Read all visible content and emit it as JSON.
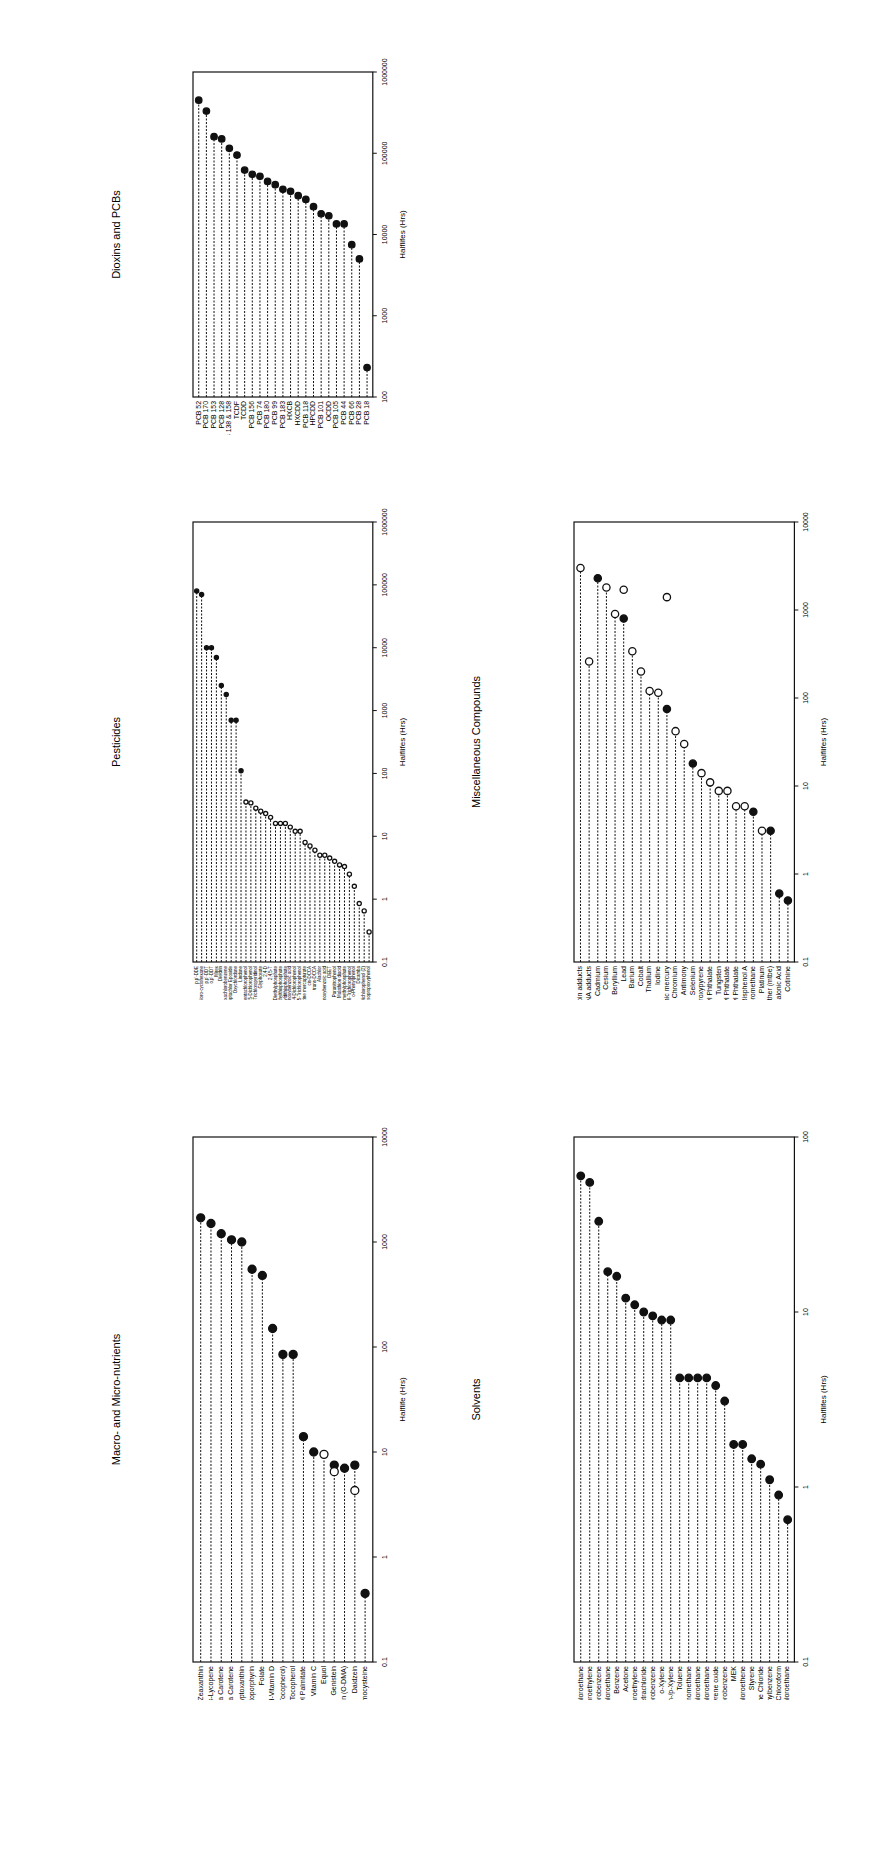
{
  "page": {
    "background": "#ffffff",
    "ink": "#111111"
  },
  "chart_data": [
    {
      "id": "dioxins",
      "type": "lollipop",
      "title": "Dioxins and PCBs",
      "ylabel": "Halflifes (Hrs)",
      "scale": "log",
      "ylim": [
        100,
        1000000
      ],
      "ticks": [
        "100",
        "1000",
        "10000",
        "100000",
        "1000000"
      ],
      "categories": [
        "PCB 52",
        "PCB 170",
        "PCB 153",
        "PCB 128",
        "PCB 138 & 158",
        "TCDF",
        "TCDD",
        "PCB 156",
        "PCB 74",
        "PCB 180",
        "PCB 99",
        "PCB 183",
        "HXCB",
        "HXCDD",
        "PCB 118",
        "HPCDD",
        "PCB 101",
        "OCDD",
        "PCB 105",
        "PCB 44",
        "PCB 66",
        "PCB 28",
        "PCB 18"
      ],
      "values": [
        450000,
        330000,
        160000,
        150000,
        115000,
        95000,
        62000,
        55000,
        52000,
        45000,
        41000,
        36000,
        34000,
        30000,
        27000,
        22000,
        18000,
        17000,
        13500,
        13500,
        7500,
        5000,
        230
      ],
      "filled": [
        true,
        true,
        true,
        true,
        true,
        true,
        true,
        true,
        true,
        true,
        true,
        true,
        true,
        true,
        true,
        true,
        true,
        true,
        true,
        true,
        true,
        true,
        true
      ]
    },
    {
      "id": "pesticides",
      "type": "lollipop",
      "title": "Pesticides",
      "ylabel": "Halflifes (Hrs)",
      "scale": "log",
      "ylim": [
        0.1,
        1000000
      ],
      "ticks": [
        "0.1",
        "1",
        "10",
        "100",
        "1000",
        "10000",
        "100000",
        "1000000"
      ],
      "categories": [
        "p,p'-DDE",
        "Beta-hexachloro-cyclohexane",
        "p,p'-DDT",
        "o,p'-DDT",
        "Mirex",
        "Dieldrin",
        "Hexachlorobenzene",
        "Heptachlor Epoxide",
        "Oxychlordane",
        "Lindane",
        "Pentachlorophenol",
        "2,5-Dichlorophenol",
        "3,5,6-Trichloropyridinol",
        "Glyphosate",
        "2,4-D",
        "2,4,5-T",
        "Diethylphosphate",
        "Diethylthiophosphate",
        "Diethyldithiophosphate",
        "3-Phenoxybenzoic acid",
        "2,4-Dichlorophenol",
        "2,4,5-Trichlorophenol",
        "Atrazine mercapturate",
        "cis-DCCA",
        "trans-DCCA",
        "Alachlor",
        "4-fluoro-3-phenoxybenzoic acid",
        "DEET",
        "Paranitrophenol",
        "Malathion diacid",
        "Dimethylphosphate",
        "2,4,6-Trichlorophenol",
        "o-Phenylphenol",
        "Dicamba",
        "2,4-Dichlorophenol (2)",
        "2-Isopropoxyphenol"
      ],
      "values": [
        80000,
        70000,
        10000,
        10000,
        7000,
        2500,
        1800,
        700,
        700,
        110,
        35,
        34,
        28,
        25,
        23,
        20,
        16,
        16,
        16,
        14,
        12,
        12,
        8,
        7,
        6,
        5,
        5,
        4.5,
        4,
        3.5,
        3.3,
        2.5,
        1.6,
        0.85,
        0.65,
        0.3
      ],
      "filled": [
        true,
        true,
        true,
        true,
        true,
        true,
        true,
        true,
        true,
        true,
        false,
        false,
        false,
        false,
        false,
        false,
        false,
        false,
        false,
        false,
        false,
        false,
        false,
        false,
        false,
        false,
        false,
        false,
        false,
        false,
        false,
        false,
        false,
        false,
        false,
        false
      ]
    },
    {
      "id": "nutrients",
      "type": "lollipop",
      "title": "Macro- and Micro-nutrients",
      "ylabel": "Halflife (Hrs)",
      "scale": "log",
      "ylim": [
        0.1,
        10000
      ],
      "ticks": [
        "0.1",
        "1",
        "10",
        "100",
        "1000",
        "10000"
      ],
      "categories": [
        "Lutein/Zeaxanthin",
        "Trans-Lycopene",
        "cis-Beta Carotene",
        "trans-Beta Carotene",
        "Beta-Cryptoxanthin",
        "Protoporphyrin",
        "Folate",
        "25-OH-Vitamin D",
        "Vitamin E (Alpha Tocopherol)",
        "Gamma Tocopherol",
        "Retinyl Palmitate",
        "Vitamin C",
        "Equol",
        "Genistein",
        "o-Desmethylangolensin (O-DMA)",
        "Daidzein",
        "Homocysteine"
      ],
      "values": [
        1700,
        1500,
        1200,
        1050,
        1000,
        550,
        480,
        150,
        85,
        85,
        14,
        10,
        9.5,
        7.5,
        7,
        7.5,
        0.45
      ],
      "filled": [
        true,
        true,
        true,
        true,
        true,
        true,
        true,
        true,
        true,
        true,
        true,
        true,
        false,
        true,
        true,
        true,
        true
      ],
      "secondary": [
        {
          "index": 13,
          "value": 6.5,
          "filled": false
        },
        {
          "index": 15,
          "value": 4.3,
          "filled": false
        }
      ]
    },
    {
      "id": "misc",
      "type": "lollipop",
      "title": "Miscellaneous Compounds",
      "ylabel": "Halflifes (Hrs)",
      "scale": "log",
      "ylim": [
        0.1,
        10000
      ],
      "ticks": [
        "0.1",
        "1",
        "10",
        "100",
        "1000",
        "10000"
      ],
      "categories": [
        "Heamoglobin adducts",
        "DNA adducts",
        "Cadmium",
        "Cesium",
        "Beryllium",
        "Lead",
        "Barium",
        "Cobalt",
        "Thallium",
        "Iodine",
        "Inorganic mercury",
        "Chromium",
        "Antimony",
        "Selenium",
        "1-hydroxypyrene",
        "mono-(2-ethyl)-hexyl Phthalate",
        "Tungsten",
        "mono-n-octyl Phthalate",
        "mono-benzyl Phthalate",
        "Bisphenol A",
        "Bromodichloromethane",
        "Platinum",
        "Methyl-t-Butyl Ether (mtbe)",
        "Methylmalonic Acid",
        "Cotinine"
      ],
      "values": [
        3000,
        260,
        2300,
        1800,
        900,
        800,
        340,
        200,
        120,
        115,
        75,
        42,
        30,
        18,
        14,
        11,
        8.8,
        8.8,
        5.9,
        5.9,
        5.1,
        3.1,
        3.1,
        0.6,
        0.5
      ],
      "filled": [
        false,
        false,
        true,
        false,
        false,
        true,
        false,
        false,
        false,
        false,
        true,
        false,
        false,
        true,
        false,
        false,
        false,
        false,
        false,
        false,
        true,
        false,
        true,
        true,
        true
      ],
      "secondary": [
        {
          "index": 5,
          "value": 1700,
          "filled": false
        },
        {
          "index": 10,
          "value": 1400,
          "filled": false
        }
      ]
    },
    {
      "id": "solvents",
      "type": "lollipop",
      "title": "Solvents",
      "ylabel": "Halflifes (Hrs)",
      "scale": "log",
      "ylim": [
        0.1,
        100
      ],
      "ticks": [
        "0.1",
        "1",
        "10",
        "100"
      ],
      "categories": [
        "Hexachloroethane",
        "Tetrachloroethylene",
        "1,4-Dichlorobenzene",
        "1,1,1-Trichloroethane",
        "Benzene",
        "Acetone",
        "Trichloroethylene",
        "Carbon Tetrachloride",
        "1,3-Dichlorobenzene",
        "o-Xylene",
        "m-/p-Xylene",
        "Toluene",
        "Dibromomethane",
        "1,1,2-Trichloroethane",
        "1,1,2,2-Tetrachloroethane",
        "Styrene oxide",
        "Chlorobenzene",
        "MEK",
        "1,1-Dichloroethene",
        "Styrene",
        "Methylene Chloride",
        "Ethylbenzene",
        "Chloroform",
        "1,2-Dichloroethane"
      ],
      "values": [
        60,
        55,
        33,
        17,
        16,
        12,
        11,
        10,
        9.5,
        9,
        9,
        4.2,
        4.2,
        4.2,
        4.2,
        3.8,
        3.1,
        1.75,
        1.75,
        1.45,
        1.35,
        1.1,
        0.9,
        0.65
      ],
      "filled": [
        true,
        true,
        true,
        true,
        true,
        true,
        true,
        true,
        true,
        true,
        true,
        true,
        true,
        true,
        true,
        true,
        true,
        true,
        true,
        true,
        true,
        true,
        true,
        true
      ]
    }
  ],
  "layout": [
    {
      "id": "dioxins",
      "x": 100,
      "y": 40,
      "w": 310,
      "h": 395
    },
    {
      "id": "pesticides",
      "x": 100,
      "y": 490,
      "w": 310,
      "h": 510
    },
    {
      "id": "nutrients",
      "x": 100,
      "y": 1105,
      "w": 310,
      "h": 595
    },
    {
      "id": "misc",
      "x": 460,
      "y": 490,
      "w": 380,
      "h": 510
    },
    {
      "id": "solvents",
      "x": 460,
      "y": 1105,
      "w": 380,
      "h": 595
    }
  ]
}
